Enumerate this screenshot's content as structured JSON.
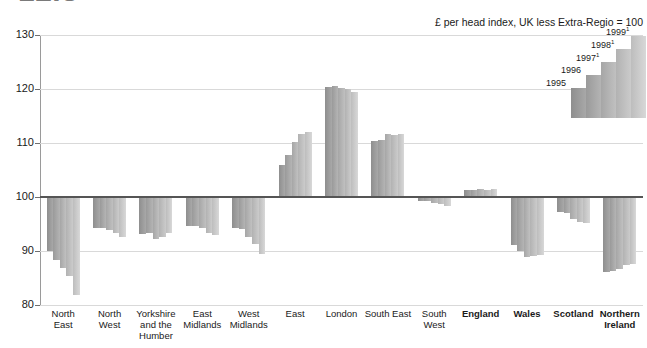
{
  "figure": {
    "title": "12.3",
    "subtitle": "£ per head index, UK less Extra-Regio = 100"
  },
  "legend": {
    "position": "top-right",
    "entries": [
      {
        "label": "1995",
        "sup": ""
      },
      {
        "label": "1996",
        "sup": ""
      },
      {
        "label": "1997",
        "sup": "1"
      },
      {
        "label": "1998",
        "sup": "1"
      },
      {
        "label": "1999",
        "sup": "1"
      }
    ]
  },
  "axis": {
    "y_ticks": [
      "130",
      "120",
      "110",
      "100",
      "90",
      "80"
    ],
    "y_values": [
      130,
      120,
      110,
      100,
      90,
      80
    ]
  },
  "chart_data": {
    "type": "bar",
    "title": "12.3",
    "subtitle": "£ per head index, UK less Extra-Regio = 100",
    "xlabel": "",
    "ylabel": "",
    "ylim": [
      80,
      130
    ],
    "baseline": 100,
    "grid": true,
    "legend_position": "top-right",
    "categories": [
      "North East",
      "North West",
      "Yorkshire and the Humber",
      "East Midlands",
      "West Midlands",
      "East",
      "London",
      "South East",
      "South West",
      "England",
      "Wales",
      "Scotland",
      "Northern Ireland"
    ],
    "categories_bold": [
      false,
      false,
      false,
      false,
      false,
      false,
      false,
      false,
      false,
      true,
      true,
      true,
      true
    ],
    "categories_lines": [
      [
        "North",
        "East"
      ],
      [
        "North",
        "West"
      ],
      [
        "Yorkshire",
        "and the",
        "Humber"
      ],
      [
        "East",
        "Midlands"
      ],
      [
        "West",
        "Midlands"
      ],
      [
        "East"
      ],
      [
        "London"
      ],
      [
        "South East"
      ],
      [
        "South",
        "West"
      ],
      [
        "England"
      ],
      [
        "Wales"
      ],
      [
        "Scotland"
      ],
      [
        "Northern",
        "Ireland"
      ]
    ],
    "series": [
      {
        "name": "1995",
        "values": [
          90.0,
          94.2,
          93.2,
          94.6,
          94.2,
          106.0,
          120.3,
          110.3,
          99.2,
          101.3,
          91.2,
          97.2,
          86.2
        ]
      },
      {
        "name": "1996",
        "values": [
          88.3,
          94.3,
          93.3,
          94.6,
          94.0,
          107.8,
          120.5,
          110.6,
          99.2,
          101.3,
          90.0,
          97.0,
          86.3
        ]
      },
      {
        "name": "1997",
        "values": [
          86.9,
          93.8,
          92.2,
          94.3,
          92.6,
          110.2,
          120.2,
          111.6,
          98.8,
          101.4,
          88.9,
          96.0,
          86.7
        ]
      },
      {
        "name": "1998",
        "values": [
          85.4,
          93.3,
          92.6,
          93.4,
          91.3,
          111.6,
          120.0,
          111.5,
          98.7,
          101.3,
          89.0,
          95.3,
          87.4
        ]
      },
      {
        "name": "1999",
        "values": [
          81.8,
          92.6,
          93.4,
          93.0,
          89.4,
          112.1,
          119.5,
          111.6,
          98.3,
          101.4,
          89.3,
          95.1,
          87.6
        ]
      }
    ]
  }
}
